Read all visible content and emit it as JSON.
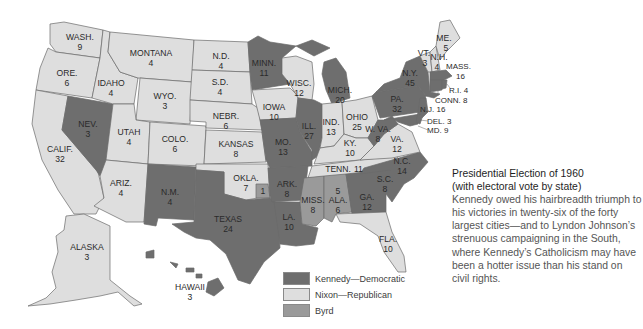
{
  "colors": {
    "kennedy": "#6e6e6e",
    "nixon": "#dedede",
    "byrd": "#9a9a9a",
    "water": "#ffffff",
    "border": "#6a6a6a"
  },
  "legend": [
    {
      "party": "kennedy",
      "label": "Kennedy—Democratic"
    },
    {
      "party": "nixon",
      "label": "Nixon—Republican"
    },
    {
      "party": "byrd",
      "label": "Byrd"
    }
  ],
  "caption": {
    "title": "Presidential Election of 1960",
    "subtitle": "(with electoral vote by state)",
    "body": "Kennedy owed his hairbreadth triumph to his victories in twenty-six of the forty largest cities—and to Lyndon Johnson’s strenuous campaigning in the South, where Kennedy’s Catholicism may have been a hotter issue than his stand on civil rights."
  },
  "states": {
    "wash": {
      "name": "WASH.",
      "votes": "9",
      "party": "nixon"
    },
    "ore": {
      "name": "ORE.",
      "votes": "6",
      "party": "nixon"
    },
    "calif": {
      "name": "CALIF.",
      "votes": "32",
      "party": "nixon"
    },
    "nev": {
      "name": "NEV.",
      "votes": "3",
      "party": "kennedy"
    },
    "idaho": {
      "name": "IDAHO",
      "votes": "4",
      "party": "nixon"
    },
    "montana": {
      "name": "MONTANA",
      "votes": "4",
      "party": "nixon"
    },
    "wyo": {
      "name": "WYO.",
      "votes": "3",
      "party": "nixon"
    },
    "utah": {
      "name": "UTAH",
      "votes": "4",
      "party": "nixon"
    },
    "ariz": {
      "name": "ARIZ.",
      "votes": "4",
      "party": "nixon"
    },
    "colo": {
      "name": "COLO.",
      "votes": "6",
      "party": "nixon"
    },
    "nm": {
      "name": "N.M.",
      "votes": "4",
      "party": "kennedy"
    },
    "nd": {
      "name": "N.D.",
      "votes": "4",
      "party": "nixon"
    },
    "sd": {
      "name": "S.D.",
      "votes": "4",
      "party": "nixon"
    },
    "nebr": {
      "name": "NEBR.",
      "votes": "6",
      "party": "nixon"
    },
    "kansas": {
      "name": "KANSAS",
      "votes": "8",
      "party": "nixon"
    },
    "okla": {
      "name": "OKLA.",
      "votes": "7",
      "party": "nixon",
      "byrd_votes": "1"
    },
    "texas": {
      "name": "TEXAS",
      "votes": "24",
      "party": "kennedy"
    },
    "minn": {
      "name": "MINN.",
      "votes": "11",
      "party": "kennedy"
    },
    "iowa": {
      "name": "IOWA",
      "votes": "10",
      "party": "nixon"
    },
    "mo": {
      "name": "MO.",
      "votes": "13",
      "party": "kennedy"
    },
    "ark": {
      "name": "ARK.",
      "votes": "8",
      "party": "kennedy"
    },
    "la": {
      "name": "LA.",
      "votes": "10",
      "party": "kennedy"
    },
    "wisc": {
      "name": "WISC.",
      "votes": "12",
      "party": "nixon"
    },
    "ill": {
      "name": "ILL.",
      "votes": "27",
      "party": "kennedy"
    },
    "mich": {
      "name": "MICH.",
      "votes": "20",
      "party": "kennedy"
    },
    "ind": {
      "name": "IND.",
      "votes": "13",
      "party": "nixon"
    },
    "ohio": {
      "name": "OHIO",
      "votes": "25",
      "party": "nixon"
    },
    "ky": {
      "name": "KY.",
      "votes": "10",
      "party": "nixon"
    },
    "tenn": {
      "name": "TENN.",
      "votes": "11",
      "party": "nixon"
    },
    "miss": {
      "name": "MISS.",
      "votes": "8",
      "party": "byrd"
    },
    "ala": {
      "name": "ALA.",
      "votes": "6",
      "party": "byrd",
      "kennedy_votes": "5"
    },
    "ga": {
      "name": "GA.",
      "votes": "12",
      "party": "kennedy"
    },
    "fla": {
      "name": "FLA.",
      "votes": "10",
      "party": "nixon"
    },
    "sc": {
      "name": "S.C.",
      "votes": "8",
      "party": "kennedy"
    },
    "nc": {
      "name": "N.C.",
      "votes": "14",
      "party": "kennedy"
    },
    "va": {
      "name": "VA.",
      "votes": "12",
      "party": "nixon"
    },
    "wva": {
      "name": "W. VA.",
      "votes": "8",
      "party": "kennedy"
    },
    "pa": {
      "name": "PA.",
      "votes": "32",
      "party": "kennedy"
    },
    "ny": {
      "name": "N.Y.",
      "votes": "45",
      "party": "kennedy"
    },
    "vt": {
      "name": "VT.",
      "votes": "3",
      "party": "nixon"
    },
    "nh": {
      "name": "N.H.",
      "votes": "4",
      "party": "nixon"
    },
    "me": {
      "name": "ME.",
      "votes": "5",
      "party": "nixon"
    },
    "mass": {
      "name": "MASS.",
      "votes": "16",
      "party": "kennedy"
    },
    "ri": {
      "name": "R.I.",
      "votes": "4",
      "party": "kennedy",
      "inline": "R.I. 4"
    },
    "conn": {
      "name": "CONN.",
      "votes": "8",
      "party": "kennedy",
      "inline": "CONN. 8"
    },
    "nj": {
      "name": "N.J.",
      "votes": "16",
      "party": "kennedy",
      "inline": "N.J. 16"
    },
    "del": {
      "name": "DEL.",
      "votes": "3",
      "party": "kennedy",
      "inline": "DEL. 3"
    },
    "md": {
      "name": "MD.",
      "votes": "9",
      "party": "kennedy",
      "inline": "MD. 9"
    },
    "alaska": {
      "name": "ALASKA",
      "votes": "3",
      "party": "nixon"
    },
    "hawaii": {
      "name": "HAWAII",
      "votes": "3",
      "party": "kennedy"
    }
  }
}
